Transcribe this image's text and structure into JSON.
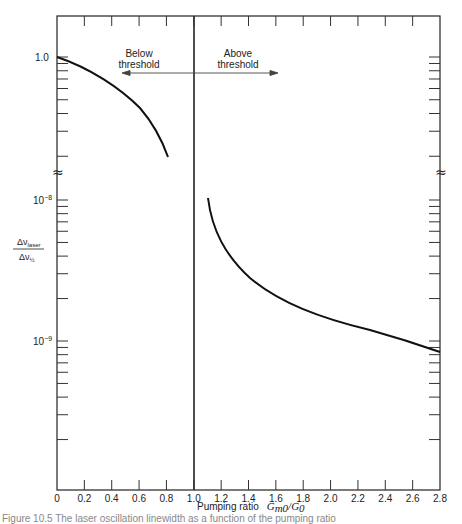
{
  "chart_data": {
    "type": "line",
    "title": "",
    "xlabel": "Pumping ratio  Gm0/G0",
    "xlabel_text": "Pumping ratio",
    "xlabel_math": "G",
    "xlabel_sub1": "m0",
    "xlabel_slash": "/G",
    "xlabel_sub2": "0",
    "ylabel": "Δν_laser / Δν_½",
    "ylabel_num": "Δν",
    "ylabel_num_sub": "laser",
    "ylabel_den": "Δν",
    "ylabel_den_sub": "½",
    "xlim": [
      0,
      2.8
    ],
    "x_ticks": [
      "0",
      "0.2",
      "0.4",
      "0.6",
      "0.8",
      "1.0",
      "1.2",
      "1.4",
      "1.6",
      "1.8",
      "2.0",
      "2.2",
      "2.4",
      "2.6",
      "2.8"
    ],
    "y_tick_labels": [
      "1.0",
      "10^-8",
      "10^-9"
    ],
    "y_label_1": "1.0",
    "y_label_2_base": "10",
    "y_label_2_exp": "−8",
    "y_label_3_base": "10",
    "y_label_3_exp": "−9",
    "y_scale": "log (broken axis)",
    "axis_break": "≈",
    "threshold_x": 1.0,
    "annotations": {
      "below_line1": "Below",
      "below_line2": "threshold",
      "above_line1": "Above",
      "above_line2": "threshold"
    },
    "series": [
      {
        "name": "Below threshold",
        "x": [
          0,
          0.1,
          0.2,
          0.3,
          0.4,
          0.5,
          0.6,
          0.7,
          0.8
        ],
        "y": [
          1.0,
          0.96,
          0.91,
          0.85,
          0.78,
          0.7,
          0.6,
          0.48,
          0.34
        ]
      },
      {
        "name": "Above threshold",
        "x": [
          1.1,
          1.2,
          1.3,
          1.4,
          1.6,
          1.8,
          2.0,
          2.2,
          2.4,
          2.6,
          2.8
        ],
        "y": [
          1e-08,
          5e-09,
          3.4e-09,
          2.6e-09,
          1.8e-09,
          1.4e-09,
          1.15e-09,
          9.5e-10,
          8e-10,
          6.8e-10,
          5.8e-10
        ]
      }
    ],
    "grid": false,
    "legend": "none"
  },
  "caption": "Figure 10.5  The laser oscillation linewidth as a function of the pumping ratio"
}
